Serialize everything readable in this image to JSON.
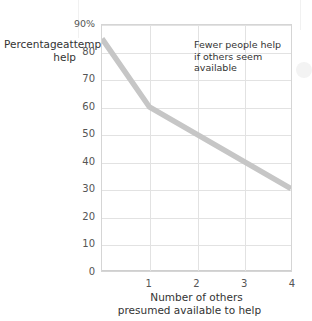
{
  "chart_data": {
    "type": "line",
    "title": "",
    "subtitle": "",
    "xlabel_lines": [
      "Number of others",
      "presumed available to help"
    ],
    "ylabel_lines": [
      "Percentage",
      "attempting",
      "to help"
    ],
    "x": [
      0,
      1,
      2,
      3,
      4
    ],
    "values": [
      85,
      60,
      50,
      40,
      30
    ],
    "series": [
      {
        "name": "Percentage attempting to help",
        "values": [
          85,
          60,
          50,
          40,
          30
        ]
      }
    ],
    "xlim": [
      0,
      4
    ],
    "ylim": [
      0,
      90
    ],
    "xticks": [
      1,
      2,
      3,
      4
    ],
    "xtick_labels": [
      "1",
      "2",
      "3",
      "4"
    ],
    "yticks": [
      0,
      10,
      20,
      30,
      40,
      50,
      60,
      70,
      80,
      90
    ],
    "ytick_labels": [
      "0",
      "10",
      "20",
      "30",
      "40",
      "50",
      "60",
      "70",
      "80",
      "90%"
    ],
    "grid": true,
    "legend": "none",
    "annotations": [
      {
        "name": "bystander-effect-note",
        "lines": [
          "Fewer people help",
          "if others seem",
          "available"
        ],
        "x": 2,
        "y": 85
      }
    ],
    "line_color": "#c6c6c6",
    "grid_color": "#e2e2e2",
    "frame_color": "#d5d5d5",
    "text_color": "#3b3b3b",
    "background": "#ffffff"
  }
}
